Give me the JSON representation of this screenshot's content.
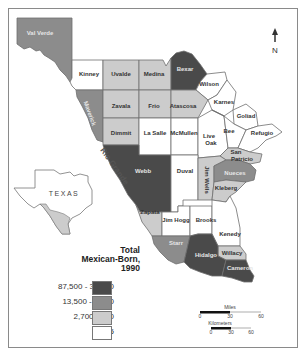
{
  "map": {
    "title_line1": "Total",
    "title_line2": "Mexican-Born,",
    "title_line3": "1990",
    "river_label": "Rio Grande",
    "inset_label": "TEXAS",
    "north_label": "N",
    "colors": {
      "dark": "#4a4a4a",
      "medium": "#8c8c8c",
      "light": "#cccccc",
      "white": "#ffffff"
    },
    "legend": [
      {
        "range": "87,500 - 31,000",
        "class": "dark"
      },
      {
        "range": "13,500 - 7,250",
        "class": "medium"
      },
      {
        "range": "2,700 - 750",
        "class": "light"
      },
      {
        "range": "< 475",
        "class": "white"
      }
    ],
    "counties": [
      {
        "name": "Val Verde",
        "class": "medium"
      },
      {
        "name": "Kinney",
        "class": "white"
      },
      {
        "name": "Uvalde",
        "class": "light"
      },
      {
        "name": "Medina",
        "class": "light"
      },
      {
        "name": "Bexar",
        "class": "dark"
      },
      {
        "name": "Wilson",
        "class": "white"
      },
      {
        "name": "Maverick",
        "class": "medium"
      },
      {
        "name": "Zavala",
        "class": "light"
      },
      {
        "name": "Frio",
        "class": "light"
      },
      {
        "name": "Atascosa",
        "class": "light"
      },
      {
        "name": "Karnes",
        "class": "white"
      },
      {
        "name": "Goliad",
        "class": "white"
      },
      {
        "name": "Dimmit",
        "class": "light"
      },
      {
        "name": "La Salle",
        "class": "white"
      },
      {
        "name": "McMullen",
        "class": "white"
      },
      {
        "name": "Live Oak",
        "class": "white"
      },
      {
        "name": "Bee",
        "class": "white"
      },
      {
        "name": "Refugio",
        "class": "white"
      },
      {
        "name": "San Patricio",
        "class": "light"
      },
      {
        "name": "Webb",
        "class": "dark"
      },
      {
        "name": "Duval",
        "class": "white"
      },
      {
        "name": "Jim Wells",
        "class": "light"
      },
      {
        "name": "Nueces",
        "class": "medium"
      },
      {
        "name": "Kleberg",
        "class": "light"
      },
      {
        "name": "Zapata",
        "class": "light"
      },
      {
        "name": "Jim Hogg",
        "class": "white"
      },
      {
        "name": "Brooks",
        "class": "white"
      },
      {
        "name": "Kenedy",
        "class": "white"
      },
      {
        "name": "Starr",
        "class": "medium"
      },
      {
        "name": "Willacy",
        "class": "light"
      },
      {
        "name": "Hidalgo",
        "class": "dark"
      },
      {
        "name": "Cameron",
        "class": "dark"
      }
    ],
    "scale": {
      "miles_label": "Miles",
      "miles_ticks": [
        "0",
        "30",
        "60"
      ],
      "km_label": "Kilometers",
      "km_ticks": [
        "0",
        "30",
        "60"
      ]
    }
  }
}
